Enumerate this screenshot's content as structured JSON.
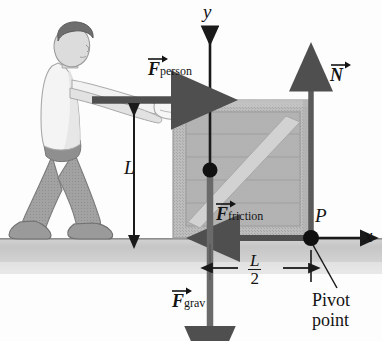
{
  "figure": {
    "type": "physics-force-diagram"
  },
  "axes": {
    "y_label": "y",
    "x_label": "x",
    "origin_label": "P"
  },
  "vectors": {
    "person": {
      "symbol": "F",
      "subscript": "person",
      "direction": "right"
    },
    "normal": {
      "symbol": "N",
      "subscript": "",
      "direction": "up"
    },
    "friction": {
      "symbol": "F",
      "subscript": "friction",
      "direction": "left"
    },
    "grav": {
      "symbol": "F",
      "subscript": "grav",
      "direction": "down"
    }
  },
  "dimensions": {
    "height_label": "L",
    "half_numerator": "L",
    "half_denominator": "2"
  },
  "annotations": {
    "pivot_line1": "Pivot",
    "pivot_line2": "point"
  },
  "colors": {
    "vector": "#4f4f4f",
    "axis": "#1a1a1a",
    "crate_fill": "#b9b9b9",
    "crate_inner": "#aeaeae",
    "crate_brace": "#cfcfcf",
    "ground": "#c9c9c9",
    "skin": "#d8d8d8",
    "shirt": "#f2f2f2",
    "pants": "#9d9d9d",
    "hair": "#6d6d6d",
    "text": "#131313"
  }
}
